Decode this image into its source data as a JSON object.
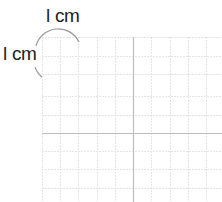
{
  "diagram": {
    "title": "",
    "labels": {
      "top": "l cm",
      "left": "l cm"
    },
    "grid": {
      "origin": [
        133,
        133
      ],
      "cell_size_px": 18.3,
      "left": 42,
      "top": 37,
      "right": 222,
      "bottom": 202,
      "gridline_color": "#e2e2e2",
      "axis_color": "#bdbdbd",
      "arc_color": "#9a9a9a"
    }
  }
}
